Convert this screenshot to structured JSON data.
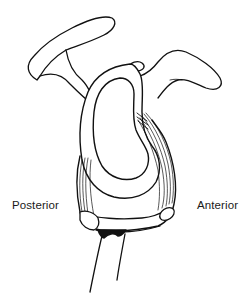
{
  "diagram": {
    "line_color": "#111111",
    "background": "#ffffff",
    "labels": {
      "posterior": "Posterior",
      "anterior": "Anterior"
    },
    "parts": [
      "acromion",
      "coracoid-process",
      "glenoid-fossa",
      "glenoid-labrum",
      "glenohumeral-ligaments",
      "biceps-tendon-origin",
      "scapular-neck"
    ]
  }
}
